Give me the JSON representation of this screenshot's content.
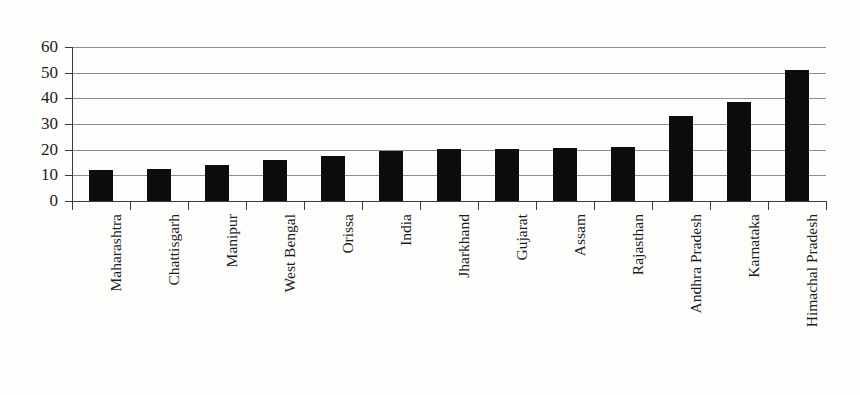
{
  "chart_data": {
    "type": "bar",
    "title": "",
    "subtitle": "",
    "xlabel": "",
    "ylabel": "",
    "categories": [
      "Maharashtra",
      "Chattisgarh",
      "Manipur",
      "West Bengal",
      "Orissa",
      "India",
      "Jharkhand",
      "Gujarat",
      "Assam",
      "Rajasthan",
      "Andhra Pradesh",
      "Karnataka",
      "Himachal Pradesh"
    ],
    "values": [
      12,
      12.5,
      14,
      16,
      17.5,
      19.5,
      20.3,
      20.3,
      20.7,
      21,
      33,
      38.5,
      51
    ],
    "ylim": [
      0,
      60
    ],
    "yticks": [
      0,
      10,
      20,
      30,
      40,
      50,
      60
    ],
    "ytick_labels": [
      "0",
      "10",
      "20",
      "30",
      "40",
      "50",
      "60"
    ],
    "grid": true,
    "grid_axis": "y",
    "legend": false,
    "legend_position": "none",
    "bar_color": "#0d0d0d",
    "gridline_color": "#8d8d8d",
    "axis_color": "#3a3a3a",
    "background_color": "#fdfdfb",
    "tick_label_rotation": -90
  }
}
